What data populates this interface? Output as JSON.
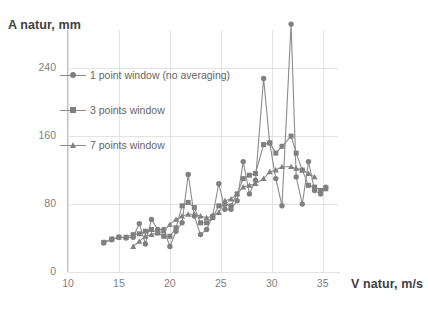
{
  "chart_data": {
    "type": "line",
    "title": "",
    "ylabel": "A natur, mm",
    "xlabel": "V natur, m/s",
    "xlim": [
      10,
      36.5
    ],
    "ylim": [
      0,
      285
    ],
    "xticks": [
      10,
      15,
      20,
      25,
      30,
      35
    ],
    "yticks": [
      0,
      80,
      160,
      240
    ],
    "grid": true,
    "legend_position": "upper-left-inside",
    "marker_color": "#808080",
    "line_color": "#8c8c8c",
    "grid_color": "#e3e3e3",
    "axis_color": "#bfbfbf",
    "series": [
      {
        "name": "1 point window (no averaging)",
        "marker": "circle",
        "x": [
          13.5,
          14.3,
          15.0,
          15.7,
          16.4,
          17.0,
          17.6,
          18.2,
          18.8,
          19.4,
          20.0,
          20.6,
          21.2,
          21.8,
          22.4,
          23.0,
          23.6,
          24.2,
          24.8,
          25.4,
          26.0,
          26.6,
          27.2,
          27.8,
          28.4,
          29.2,
          29.8,
          30.4,
          31.0,
          31.9,
          32.4,
          33.0,
          33.6,
          34.2,
          34.8,
          35.3
        ],
        "y": [
          34,
          38,
          41,
          40,
          41,
          57,
          33,
          62,
          50,
          50,
          30,
          48,
          58,
          115,
          66,
          44,
          50,
          66,
          104,
          74,
          74,
          84,
          130,
          92,
          108,
          228,
          152,
          110,
          78,
          292,
          112,
          80,
          130,
          96,
          92,
          100
        ]
      },
      {
        "name": "3 points window",
        "marker": "square",
        "x": [
          13.5,
          14.3,
          15.0,
          15.7,
          16.4,
          17.0,
          17.6,
          18.2,
          18.8,
          19.4,
          20.0,
          20.6,
          21.2,
          21.8,
          22.4,
          23.0,
          23.6,
          24.2,
          24.8,
          25.4,
          26.0,
          26.6,
          27.2,
          27.8,
          28.4,
          29.2,
          29.8,
          30.4,
          31.0,
          31.9,
          32.4,
          33.0,
          33.6,
          34.2,
          34.8,
          35.3
        ],
        "y": [
          35,
          39,
          41,
          41,
          44,
          45,
          48,
          50,
          46,
          42,
          42,
          52,
          78,
          82,
          76,
          58,
          58,
          64,
          78,
          80,
          78,
          92,
          110,
          114,
          116,
          150,
          152,
          140,
          148,
          160,
          140,
          120,
          102,
          100,
          96,
          98
        ]
      },
      {
        "name": "7 points window",
        "marker": "triangle",
        "x": [
          16.4,
          17.0,
          17.6,
          18.2,
          18.8,
          19.4,
          20.0,
          20.6,
          21.2,
          21.8,
          22.4,
          23.0,
          23.6,
          24.2,
          24.8,
          25.4,
          26.0,
          26.6,
          27.2,
          27.8,
          28.4,
          29.2,
          29.8,
          30.4,
          31.0,
          31.9,
          32.4,
          33.0,
          33.6,
          34.2
        ],
        "y": [
          30,
          36,
          42,
          44,
          46,
          48,
          56,
          62,
          66,
          68,
          68,
          66,
          64,
          66,
          70,
          84,
          86,
          92,
          100,
          102,
          104,
          110,
          118,
          120,
          124,
          124,
          122,
          120,
          116,
          112
        ]
      }
    ]
  },
  "axis": {
    "y_title": "A natur, mm",
    "x_title": "V natur, m/s",
    "ytick_labels": [
      "240",
      "160",
      "80",
      "0"
    ],
    "xtick_labels": [
      "10",
      "15",
      "20",
      "25",
      "30",
      "35"
    ]
  },
  "legend": {
    "items": [
      {
        "label": "1 point window (no averaging)",
        "marker": "circle-marker"
      },
      {
        "label": "3 points window",
        "marker": "square-marker"
      },
      {
        "label": "7 points window",
        "marker": "triangle-marker"
      }
    ]
  }
}
